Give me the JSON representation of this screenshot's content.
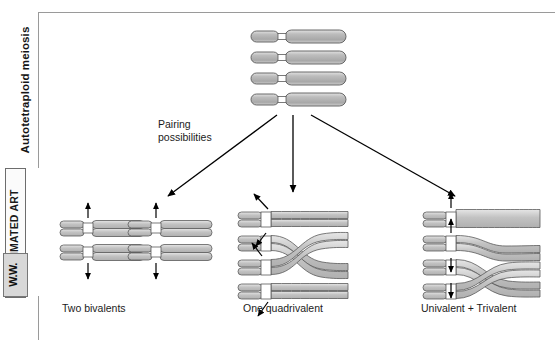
{
  "rail": {
    "title": "Autotetraploid meiosis",
    "badge_label": "ANIMATED ART",
    "publisher_logo": "W.W."
  },
  "figure": {
    "pairing_label_line1": "Pairing",
    "pairing_label_line2": "possibilities",
    "panels": [
      {
        "id": "two-bivalents",
        "caption": "Two bivalents"
      },
      {
        "id": "one-quadrivalent",
        "caption": "One quadrivalent"
      },
      {
        "id": "univalent-trivalent",
        "caption": "Univalent + Trivalent"
      }
    ]
  },
  "colors": {
    "chromosome_fill": "#b3b3b3",
    "chromosome_fill_light": "#cfcfcf",
    "chromosome_stroke": "#5a5a5a",
    "centromere": "#ffffff",
    "arrow": "#000000",
    "frame": "#9a9a9a",
    "text": "#1b1b1b",
    "background": "#ffffff"
  },
  "diagram": {
    "type": "biology-schematic",
    "parent_set": {
      "label": "Four homologous chromosomes",
      "count": 4,
      "description": "Four identical metacentric chromosomes stacked vertically, each with a short left arm, a white centromere gap, and a long right arm"
    },
    "branch_arrows": 3,
    "outcomes": [
      {
        "name": "Two bivalents",
        "groups": 2,
        "chromosomes_per_group": 2,
        "chromatids_per_group": 4
      },
      {
        "name": "One quadrivalent",
        "groups": 1,
        "chromosomes_per_group": 4,
        "chromatids_per_group": 8
      },
      {
        "name": "Univalent + Trivalent",
        "groups": 2,
        "univalent": 1,
        "trivalent": 3
      }
    ]
  }
}
